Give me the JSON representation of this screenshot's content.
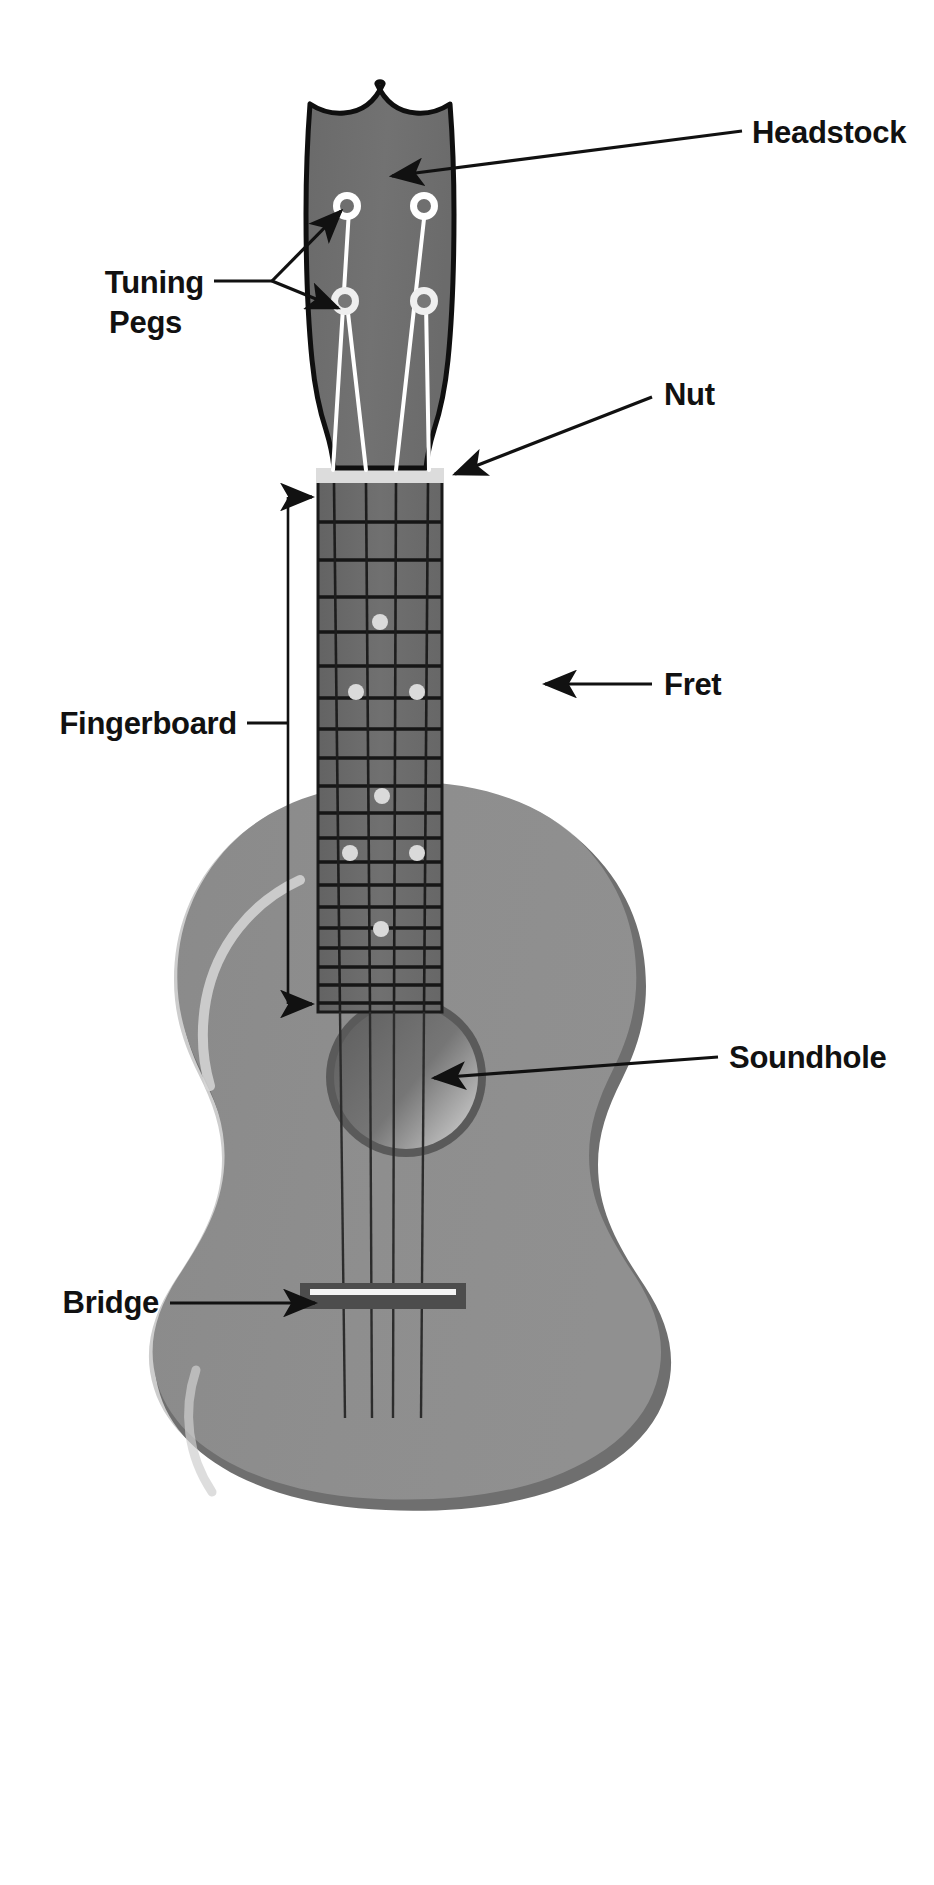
{
  "diagram": {
    "background_color": "#ffffff"
  },
  "colors": {
    "headstock_fill": "#6e6e6e",
    "headstock_stroke": "#101010",
    "fingerboard_fill": "#6b6b6b",
    "fret_line": "#1a1a1a",
    "nut_fill": "#d8d8d8",
    "body_fill": "#8d8d8d",
    "body_edge": "#c9c9c9",
    "body_shadow": "#6f6f6f",
    "soundhole_fill": "#6a6a6a",
    "soundhole_ring": "#555555",
    "bridge_fill": "#4f4f4f",
    "saddle_fill": "#f2f2f2",
    "string_dark": "#2b2b2b",
    "string_light": "#ffffff",
    "peg_ring": "#ffffff",
    "inlay_dot": "#d9d9d9",
    "label_text": "#111111",
    "leader_line": "#111111"
  },
  "labels": [
    {
      "id": "headstock",
      "text": "Headstock",
      "x": 752,
      "y": 140,
      "anchor": "start"
    },
    {
      "id": "tuning_pegs_line1",
      "text": "Tuning",
      "x": 200,
      "y": 290,
      "anchor": "end"
    },
    {
      "id": "tuning_pegs_line2",
      "text": "Pegs",
      "x": 200,
      "y": 330,
      "anchor": "end"
    },
    {
      "id": "nut",
      "text": "Nut",
      "x": 662,
      "y": 404,
      "anchor": "start"
    },
    {
      "id": "fingerboard",
      "text": "Fingerboard",
      "x": 233,
      "y": 732,
      "anchor": "end"
    },
    {
      "id": "fret",
      "text": "Fret",
      "x": 662,
      "y": 693,
      "anchor": "start"
    },
    {
      "id": "soundhole",
      "text": "Soundhole",
      "x": 727,
      "y": 1066,
      "anchor": "start"
    },
    {
      "id": "bridge",
      "text": "Bridge",
      "x": 155,
      "y": 1311,
      "anchor": "end"
    }
  ],
  "parts": {
    "headstock": {
      "name": "Headstock",
      "description": "Dark crowned shield shape at the top of the instrument",
      "bbox": [
        303,
        84,
        458,
        445
      ]
    },
    "tuning_pegs": {
      "name": "Tuning Pegs",
      "count": 4,
      "positions": [
        {
          "cx": 347,
          "cy": 206
        },
        {
          "cx": 423,
          "cy": 206
        },
        {
          "cx": 345,
          "cy": 301
        },
        {
          "cx": 424,
          "cy": 301
        }
      ],
      "outer_radius": 13,
      "inner_radius": 6
    },
    "nut": {
      "name": "Nut",
      "bbox": [
        317,
        469,
        443,
        483
      ]
    },
    "fingerboard": {
      "name": "Fingerboard",
      "bbox": [
        318,
        483,
        442,
        1012
      ],
      "fret_count": 15
    },
    "frets": {
      "name": "Fret",
      "y_positions": [
        483,
        522,
        560,
        597,
        632,
        666,
        698,
        729,
        758,
        786,
        813,
        838,
        862,
        885,
        907,
        928,
        948,
        967,
        985,
        1003
      ],
      "line_width": 3.4
    },
    "inlay_dots": [
      {
        "cx": 380,
        "cy": 622
      },
      {
        "cx": 356,
        "cy": 692
      },
      {
        "cx": 417,
        "cy": 692
      },
      {
        "cx": 382,
        "cy": 796
      },
      {
        "cx": 350,
        "cy": 853
      },
      {
        "cx": 417,
        "cy": 853
      },
      {
        "cx": 381,
        "cy": 929
      }
    ],
    "strings": {
      "name": "Strings",
      "count": 4,
      "nut_x": [
        331,
        365,
        396,
        430
      ],
      "bridge_x": [
        342,
        372,
        393,
        423
      ]
    },
    "body": {
      "name": "Body",
      "bbox": [
        196,
        848,
        680,
        1445
      ]
    },
    "soundhole": {
      "name": "Soundhole",
      "cx": 406,
      "cy": 1077,
      "radius": 78
    },
    "bridge": {
      "name": "Bridge",
      "bbox": [
        300,
        1283,
        466,
        1308
      ]
    }
  },
  "leaders": {
    "headstock": {
      "from": [
        742,
        132
      ],
      "to": [
        392,
        178
      ]
    },
    "tuning_pegs": {
      "stem_from": [
        212,
        281
      ],
      "stem_to": [
        272,
        281
      ],
      "branch_a": [
        343,
        212
      ],
      "branch_b": [
        340,
        308
      ]
    },
    "nut": {
      "from": [
        650,
        398
      ],
      "to": [
        452,
        475
      ]
    },
    "fret": {
      "from": [
        650,
        684
      ],
      "to": [
        543,
        684
      ]
    },
    "fingerboard": {
      "stem_from": [
        245,
        723
      ],
      "stem_to": [
        288,
        723
      ],
      "top_arrow": [
        315,
        497
      ],
      "bottom_arrow": [
        315,
        1004
      ]
    },
    "soundhole": {
      "from": [
        715,
        1058
      ],
      "to": [
        432,
        1078
      ]
    },
    "bridge": {
      "from": [
        168,
        1303
      ],
      "to": [
        318,
        1303
      ]
    }
  }
}
